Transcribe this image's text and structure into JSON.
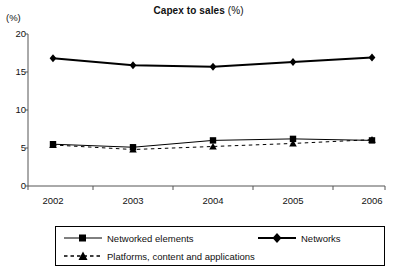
{
  "chart_data": {
    "type": "line",
    "title_main": "Capex to sales",
    "title_unit": "(%)",
    "xlabel": "",
    "ylabel": "(%)",
    "yunit_label": "(%)",
    "categories": [
      "2002",
      "2003",
      "2004",
      "2005",
      "2006"
    ],
    "x": [
      2002,
      2003,
      2004,
      2005,
      2006
    ],
    "ylim": [
      0,
      20
    ],
    "yticks": [
      0,
      5,
      10,
      15,
      20
    ],
    "ytick_labels": [
      "0",
      "5",
      "10",
      "15",
      "20"
    ],
    "grid": false,
    "legend_position": "bottom",
    "series": [
      {
        "name": "Networked elements",
        "marker": "square",
        "line_style": "solid",
        "line_width": 1,
        "color": "#000000",
        "values": [
          5.5,
          5.1,
          6.0,
          6.2,
          6.0
        ]
      },
      {
        "name": "Networks",
        "marker": "diamond",
        "line_style": "solid",
        "line_width": 2,
        "color": "#000000",
        "values": [
          16.8,
          15.9,
          15.7,
          16.3,
          16.9
        ]
      },
      {
        "name": "Platforms, content and applications",
        "marker": "triangle",
        "line_style": "dashed",
        "line_width": 1,
        "color": "#000000",
        "values": [
          5.4,
          4.8,
          5.2,
          5.6,
          6.1
        ]
      }
    ]
  },
  "legend": {
    "items": [
      {
        "label": "Networked elements"
      },
      {
        "label": "Networks"
      },
      {
        "label": "Platforms, content and applications"
      }
    ]
  }
}
